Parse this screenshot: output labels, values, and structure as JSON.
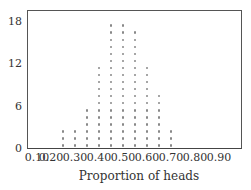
{
  "chart_data": {
    "type": "scatter",
    "subtype": "dot_plot",
    "title": "",
    "xlabel": "Proportion of heads",
    "ylabel": "",
    "xlim": [
      0.1,
      1.0
    ],
    "ylim": [
      0,
      19
    ],
    "x_ticks": [
      "0.10",
      "0.20",
      "0.30",
      "0.40",
      "0.50",
      "0.60",
      "0.70",
      "0.80",
      "0.90"
    ],
    "y_ticks": [
      "0",
      "6",
      "12",
      "18"
    ],
    "categories": [
      0.25,
      0.3,
      0.35,
      0.4,
      0.45,
      0.5,
      0.55,
      0.6,
      0.65,
      0.7
    ],
    "values": [
      3,
      3,
      6,
      12,
      18,
      18,
      17,
      12,
      8,
      3
    ],
    "grid": false,
    "dot_color": "#888888"
  }
}
